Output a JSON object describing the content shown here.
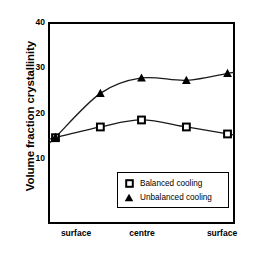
{
  "chart_data": {
    "type": "line",
    "title": "",
    "xlabel": "Position in laminate",
    "ylabel": "Volume fraction crystallinity",
    "xlim": [
      0,
      1
    ],
    "ylim": [
      -3.3,
      40
    ],
    "grid": false,
    "legend_position": "lower-right",
    "yticks": [
      {
        "value": 40,
        "label": "40"
      },
      {
        "value": 30,
        "label": "30"
      },
      {
        "value": 20,
        "label": "20"
      },
      {
        "value": 10,
        "label": "10"
      }
    ],
    "xticks": [
      {
        "value": 0.0,
        "label": "surface"
      },
      {
        "value": 0.5,
        "label": "centre"
      },
      {
        "value": 1.0,
        "label": "surface"
      }
    ],
    "x": [
      0.04,
      0.28,
      0.5,
      0.74,
      0.96
    ],
    "series": [
      {
        "name": "Balanced cooling",
        "marker": "square",
        "values": [
          15.2,
          17.5,
          19.0,
          17.5,
          16.0
        ]
      },
      {
        "name": "Unbalanced cooling",
        "marker": "triangle",
        "values": [
          15.3,
          24.7,
          28.0,
          27.5,
          29.0
        ]
      }
    ],
    "colors": {
      "axis": "#000000",
      "marker": "#000000",
      "curve": "#1a1a1a",
      "background": "#ffffff"
    }
  },
  "legend": {
    "entries": [
      {
        "label": "Balanced cooling",
        "marker": "square-marker"
      },
      {
        "label": "Unbalanced cooling",
        "marker": "triangle-marker"
      }
    ]
  }
}
